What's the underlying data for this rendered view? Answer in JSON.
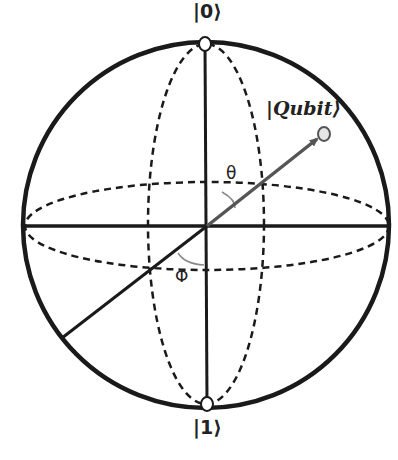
{
  "diagram": {
    "labels": {
      "north_pole": "|0⟩",
      "south_pole": "|1⟩",
      "state_vector": "|Qubit⟩",
      "polar_angle": "θ",
      "azimuthal_angle": "Φ"
    },
    "colors": {
      "stroke": "#1a1a1a",
      "arrow": "#555555",
      "angle_arc": "#888888",
      "background": "#ffffff"
    }
  }
}
